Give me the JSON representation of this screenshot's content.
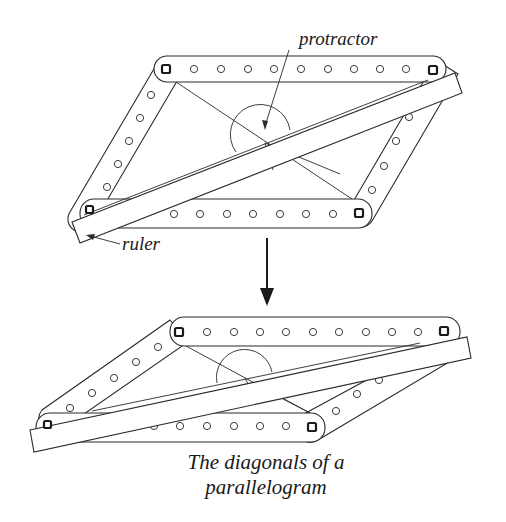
{
  "diagram": {
    "labels": {
      "protractor": "protractor",
      "ruler": "ruler"
    },
    "caption": {
      "line1": "The diagonals of a",
      "line2": "parallelogram"
    },
    "colors": {
      "ink": "#2a2a2a",
      "background": "#ffffff"
    },
    "figures": [
      {
        "id": "top",
        "description": "Linkage parallelogram (wider shape) with ruler along one diagonal and protractor at diagonal intersection"
      },
      {
        "id": "bottom",
        "description": "Same linkage deformed into flatter parallelogram; diagonals still bisect each other"
      }
    ],
    "transition": "down-arrow"
  }
}
